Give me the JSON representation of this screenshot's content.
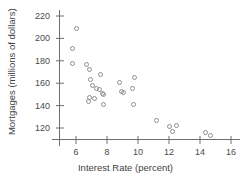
{
  "chart_data": {
    "type": "scatter",
    "title": "",
    "xlabel": "Interest Rate (percent)",
    "ylabel": "Mortgages (millions of dollars)",
    "xlim": [
      4.6,
      16.6
    ],
    "ylim": [
      108,
      224
    ],
    "xticks": [
      6,
      8,
      10,
      12,
      14,
      16
    ],
    "yticks": [
      120,
      140,
      160,
      180,
      200,
      220
    ],
    "xtick_labels": [
      "6",
      "8",
      "10",
      "12",
      "14",
      "16"
    ],
    "ytick_labels": [
      "120",
      "140",
      "160",
      "180",
      "200",
      "220"
    ],
    "grid": false,
    "legend": false,
    "marker": "open-circle",
    "marker_color": "#8e8e96",
    "points": [
      {
        "x": 6.0,
        "y": 209
      },
      {
        "x": 5.75,
        "y": 191
      },
      {
        "x": 5.75,
        "y": 178
      },
      {
        "x": 6.7,
        "y": 177
      },
      {
        "x": 6.85,
        "y": 172
      },
      {
        "x": 7.6,
        "y": 168
      },
      {
        "x": 6.95,
        "y": 163
      },
      {
        "x": 9.75,
        "y": 165
      },
      {
        "x": 7.05,
        "y": 158
      },
      {
        "x": 8.8,
        "y": 161
      },
      {
        "x": 7.35,
        "y": 155
      },
      {
        "x": 7.5,
        "y": 154
      },
      {
        "x": 9.65,
        "y": 155
      },
      {
        "x": 8.95,
        "y": 153
      },
      {
        "x": 9.05,
        "y": 152
      },
      {
        "x": 7.7,
        "y": 151
      },
      {
        "x": 7.75,
        "y": 150
      },
      {
        "x": 6.85,
        "y": 147
      },
      {
        "x": 7.2,
        "y": 146
      },
      {
        "x": 6.8,
        "y": 144
      },
      {
        "x": 7.75,
        "y": 141
      },
      {
        "x": 9.7,
        "y": 141
      },
      {
        "x": 11.2,
        "y": 127
      },
      {
        "x": 12.05,
        "y": 121
      },
      {
        "x": 12.5,
        "y": 122
      },
      {
        "x": 12.2,
        "y": 117
      },
      {
        "x": 14.35,
        "y": 116
      },
      {
        "x": 14.7,
        "y": 113
      }
    ]
  },
  "axis_style": {
    "line_color": "#6e6e6e",
    "tick_label_color": "#4a4a4a"
  }
}
